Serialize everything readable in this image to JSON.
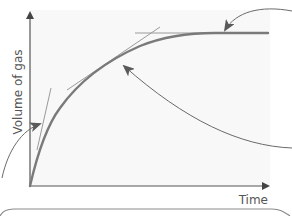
{
  "figure": {
    "type": "rate-of-reaction-graph",
    "y_axis_label": "Volume of gas",
    "x_axis_label": "Time",
    "colors": {
      "background": "#ffffff",
      "plot_area": "#f7f7f7",
      "curve": "#7a7a7a",
      "axis": "#555555",
      "tangent": "#9a9a9a",
      "arrow": "#6a6a6a",
      "box_border": "#8a8a8a"
    },
    "elements": {
      "curve": "volume-vs-time curve rising steeply then levelling off",
      "tangents": [
        {
          "position": "start of reaction",
          "description": "steep tangent near origin"
        },
        {
          "position": "middle of reaction",
          "description": "less steep tangent"
        },
        {
          "position": "end of reaction",
          "description": "horizontal tangent on plateau"
        }
      ],
      "callout_arrows": [
        {
          "from": "left",
          "points_to": "steep tangent"
        },
        {
          "from": "right",
          "points_to": "middle tangent"
        },
        {
          "from": "top-right",
          "points_to": "plateau"
        }
      ],
      "callout_box": "rounded box partially visible at bottom"
    }
  }
}
